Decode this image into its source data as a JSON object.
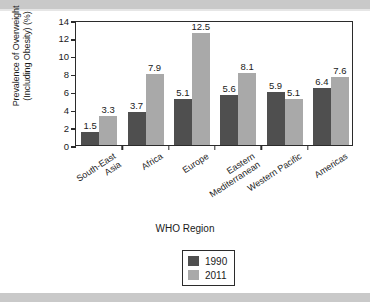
{
  "figure": {
    "ytitle": "Prevalence of Overweight\n(Including Obesity) (%)",
    "xtitle": "WHO Region"
  },
  "legend": {
    "items": [
      {
        "label": "1990",
        "color": "#4f4f4f"
      },
      {
        "label": "2011",
        "color": "#a9a9a9"
      }
    ]
  },
  "chart_data": {
    "type": "bar",
    "title": "",
    "xlabel": "WHO Region",
    "ylabel": "Prevalence of Overweight (Including Obesity) (%)",
    "ylim": [
      0,
      14
    ],
    "yticks": [
      0,
      2,
      4,
      6,
      8,
      10,
      12,
      14
    ],
    "ytick_labels": [
      "0",
      "2",
      "4",
      "6",
      "8",
      "10",
      "12",
      "14"
    ],
    "grid": false,
    "legend_position": "bottom-center",
    "categories": [
      "South-East\nAsia",
      "Africa",
      "Europe",
      "Eastern\nMediterranean",
      "Western Pacific",
      "Americas"
    ],
    "series": [
      {
        "name": "1990",
        "color": "#4f4f4f",
        "values": [
          1.5,
          3.7,
          5.1,
          5.6,
          5.9,
          6.4
        ],
        "labels": [
          "1.5",
          "3.7",
          "5.1",
          "5.6",
          "5.9",
          "6.4"
        ]
      },
      {
        "name": "2011",
        "color": "#a9a9a9",
        "values": [
          3.3,
          7.9,
          12.5,
          8.1,
          5.1,
          7.6
        ],
        "labels": [
          "3.3",
          "7.9",
          "12.5",
          "8.1",
          "5.1",
          "7.6"
        ]
      }
    ]
  }
}
